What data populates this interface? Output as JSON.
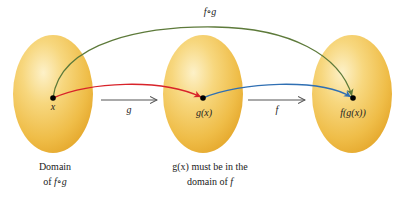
{
  "diagram": {
    "sets": [
      {
        "id": "domain-g",
        "center_label": "x",
        "caption_line1": "Domain",
        "caption_line2_prefix": "of ",
        "caption_line2_math": "f∘g"
      },
      {
        "id": "range-g",
        "center_label": "g(x)",
        "caption_line1": "g(x) must be in the",
        "caption_line2_prefix": "domain of ",
        "caption_line2_math": "f"
      },
      {
        "id": "range-f",
        "center_label": "f(g(x))"
      }
    ],
    "arrows": [
      {
        "id": "g-arrow",
        "label": "g"
      },
      {
        "id": "f-arrow",
        "label": "f"
      },
      {
        "id": "composition-arc",
        "label": "f∘g"
      }
    ],
    "colors": {
      "ellipse_light": "#fbe6a2",
      "ellipse_mid": "#f3c656",
      "ellipse_dark": "#e6a92c",
      "red_curve": "#d8232a",
      "blue_curve": "#2f6fb3",
      "green_arc": "#5d7a3a",
      "straight_arrow": "#555555",
      "dot": "#000000"
    }
  }
}
